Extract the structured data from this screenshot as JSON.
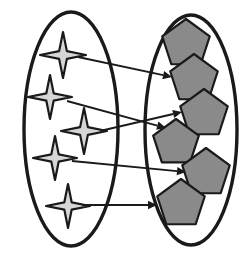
{
  "figure": {
    "type": "set-mapping-diagram",
    "title": "",
    "width": 249,
    "height": 258,
    "background_color": "#ffffff"
  },
  "colors": {
    "outline": "#1a1a1a",
    "star_fill": "#d6d6d6",
    "star_outline": "#1a1a1a",
    "pentagon_fill": "#8a8a8a",
    "pentagon_outline": "#1a1a1a",
    "arrow": "#1a1a1a",
    "ellipse_fill": "none"
  },
  "sets": {
    "domain": {
      "name": "domain-set",
      "shape": "ellipse",
      "cx": 71,
      "cy": 129,
      "rx": 47,
      "ry": 117,
      "stroke_width": 3.4,
      "member_icon": "four-pointed-star",
      "member_count": 5
    },
    "codomain": {
      "name": "codomain-set",
      "shape": "ellipse",
      "cx": 191,
      "cy": 130,
      "rx": 46,
      "ry": 115,
      "stroke_width": 3.4,
      "member_icon": "pentagon",
      "member_count": 6
    }
  },
  "domain_elements": [
    {
      "id": "star-1",
      "label": "star-1",
      "cx": 63,
      "cy": 55,
      "r_outer": 23,
      "r_inner": 5.5
    },
    {
      "id": "star-2",
      "label": "star-2",
      "cx": 50,
      "cy": 97,
      "r_outer": 22,
      "r_inner": 5.2
    },
    {
      "id": "star-3",
      "label": "star-3",
      "cx": 84,
      "cy": 131,
      "r_outer": 23,
      "r_inner": 5.5
    },
    {
      "id": "star-4",
      "label": "star-4",
      "cx": 55,
      "cy": 158,
      "r_outer": 22,
      "r_inner": 5.2
    },
    {
      "id": "star-5",
      "label": "star-5",
      "cx": 68,
      "cy": 206,
      "r_outer": 22,
      "r_inner": 5.2
    }
  ],
  "codomain_elements": [
    {
      "id": "pentagon-1",
      "label": "pentagon-1",
      "cx": 186,
      "cy": 44,
      "r": 25,
      "rotation": 0
    },
    {
      "id": "pentagon-2",
      "label": "pentagon-2",
      "cx": 194,
      "cy": 79,
      "r": 25,
      "rotation": 0
    },
    {
      "id": "pentagon-3",
      "label": "pentagon-3",
      "cx": 204,
      "cy": 114,
      "r": 25,
      "rotation": 0
    },
    {
      "id": "pentagon-4",
      "label": "pentagon-4",
      "cx": 176,
      "cy": 143,
      "r": 24,
      "rotation": 0
    },
    {
      "id": "pentagon-5",
      "label": "pentagon-5",
      "cx": 206,
      "cy": 173,
      "r": 25,
      "rotation": 0
    },
    {
      "id": "pentagon-6",
      "label": "pentagon-6",
      "cx": 181,
      "cy": 204,
      "r": 25,
      "rotation": 0
    }
  ],
  "mappings": [
    {
      "id": "arrow-1",
      "from": "star-1",
      "to": "pentagon-2",
      "x1": 78,
      "y1": 57,
      "x2": 172,
      "y2": 77
    },
    {
      "id": "arrow-2",
      "from": "star-2",
      "to": "pentagon-4",
      "x1": 67,
      "y1": 101,
      "x2": 166,
      "y2": 128
    },
    {
      "id": "arrow-3",
      "from": "star-3",
      "to": "pentagon-3",
      "x1": 100,
      "y1": 131,
      "x2": 182,
      "y2": 112
    },
    {
      "id": "arrow-4",
      "from": "star-4",
      "to": "pentagon-5",
      "x1": 72,
      "y1": 161,
      "x2": 186,
      "y2": 172
    },
    {
      "id": "arrow-5",
      "from": "star-5",
      "to": "pentagon-6",
      "x1": 82,
      "y1": 205,
      "x2": 157,
      "y2": 205
    }
  ],
  "arrow_style": {
    "stroke_width": 1.9,
    "head_length": 9,
    "head_half_width": 4.2
  }
}
